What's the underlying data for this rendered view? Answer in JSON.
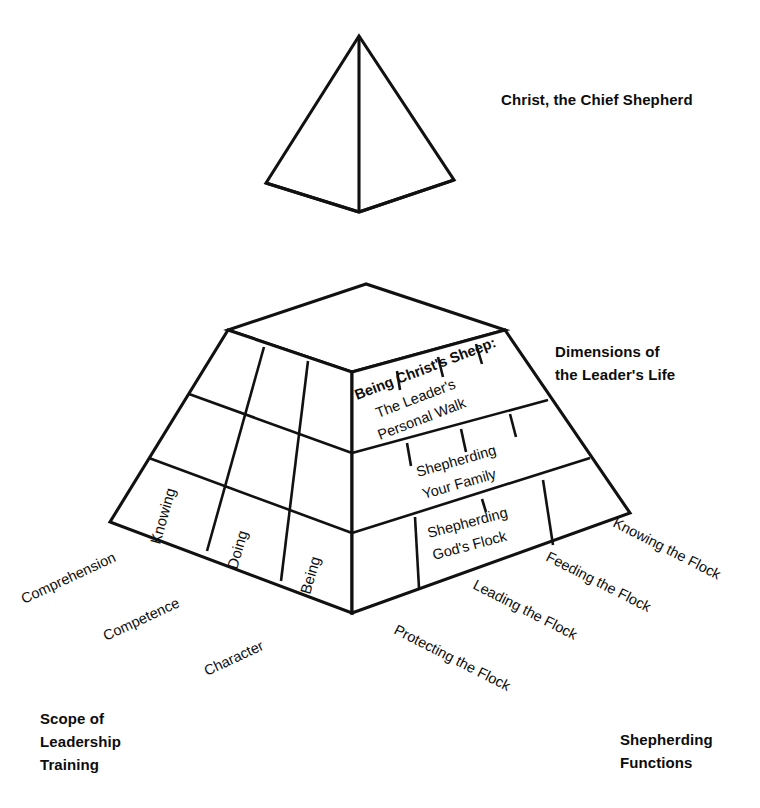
{
  "diagram": {
    "title_top": "Christ, the Chief Shepherd",
    "label_right_top": {
      "line1": "Dimensions of",
      "line2": "the Leader's Life"
    },
    "label_bottom_left": {
      "line1": "Scope of",
      "line2": "Leadership",
      "line3": "Training"
    },
    "label_bottom_right": {
      "line1": "Shepherding",
      "line2": "Functions"
    },
    "tiers": [
      {
        "id": "tier-top",
        "heading": "Being Christ's Sheep:",
        "line1": "The Leader's",
        "line2": "Personal Walk"
      },
      {
        "id": "tier-middle",
        "heading": "",
        "line1": "Shepherding",
        "line2": "Your Family"
      },
      {
        "id": "tier-bottom",
        "heading": "",
        "line1": "Shepherding",
        "line2": "God's Flock"
      }
    ],
    "left_face_cells": [
      {
        "id": "cell-knowing",
        "label": "Knowing"
      },
      {
        "id": "cell-doing",
        "label": "Doing"
      },
      {
        "id": "cell-being",
        "label": "Being"
      }
    ],
    "left_edge_labels": [
      {
        "id": "edge-comprehension",
        "label": "Comprehension"
      },
      {
        "id": "edge-competence",
        "label": "Competence"
      },
      {
        "id": "edge-character",
        "label": "Character"
      }
    ],
    "right_edge_labels": [
      {
        "id": "edge-protecting",
        "label": "Protecting the Flock"
      },
      {
        "id": "edge-leading",
        "label": "Leading the Flock"
      },
      {
        "id": "edge-feeding",
        "label": "Feeding the Flock"
      },
      {
        "id": "edge-knowing-flock",
        "label": "Knowing the Flock"
      }
    ],
    "colors": {
      "stroke": "#111111",
      "text": "#0d0d0d",
      "background": "#ffffff"
    }
  }
}
